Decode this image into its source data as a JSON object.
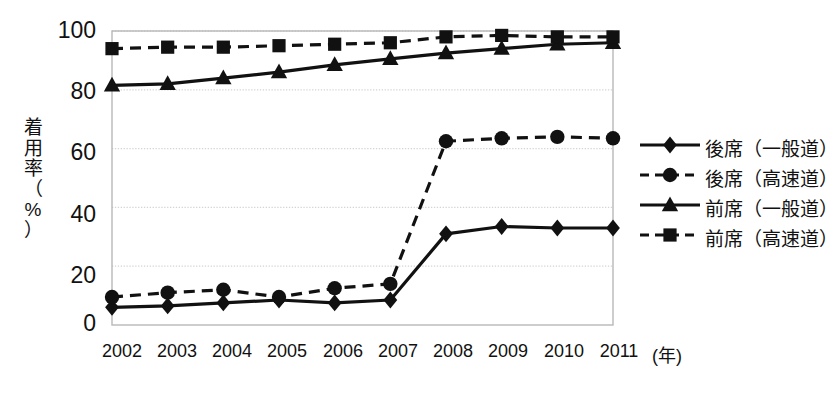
{
  "chart_data": {
    "type": "line",
    "title": "",
    "xlabel": "(年)",
    "ylabel": "着用率（%）",
    "ylabel_chars": [
      "着",
      "用",
      "率",
      "（",
      "%",
      "）"
    ],
    "categories": [
      "2002",
      "2003",
      "2004",
      "2005",
      "2006",
      "2007",
      "2008",
      "2009",
      "2010",
      "2011"
    ],
    "x": [
      2002,
      2003,
      2004,
      2005,
      2006,
      2007,
      2008,
      2009,
      2010,
      2011
    ],
    "ylim": [
      0,
      100
    ],
    "xlim": [
      2002,
      2011
    ],
    "yticks": [
      "0",
      "20",
      "40",
      "60",
      "80",
      "100"
    ],
    "ytick_values": [
      0,
      20,
      40,
      60,
      80,
      100
    ],
    "grid": true,
    "grid_axis": "y",
    "legend_position": "right",
    "series": [
      {
        "name": "後席（一般道）",
        "marker": "diamond",
        "line_style": "solid",
        "color": "#111111",
        "values": [
          6,
          6.5,
          7.5,
          8.5,
          7.5,
          8.5,
          31,
          33.5,
          33,
          33
        ]
      },
      {
        "name": "後席（高速道）",
        "marker": "circle",
        "line_style": "dashed",
        "color": "#111111",
        "values": [
          9.5,
          11,
          12,
          9.5,
          12.5,
          14,
          62.5,
          63.5,
          64,
          63.5
        ]
      },
      {
        "name": "前席（一般道）",
        "marker": "triangle",
        "line_style": "solid",
        "color": "#111111",
        "values": [
          81.5,
          82,
          84,
          86,
          88.5,
          90.5,
          92.5,
          94,
          95.5,
          96
        ]
      },
      {
        "name": "前席（高速道）",
        "marker": "square",
        "line_style": "dashed",
        "color": "#111111",
        "values": [
          94,
          94.5,
          94.5,
          95,
          95.5,
          96,
          98,
          98.5,
          98,
          98
        ]
      }
    ]
  },
  "style": {
    "background": "#ffffff",
    "grid_color": "#d4d4d4",
    "frame_color": "#b8b8b8",
    "ink": "#111111"
  }
}
